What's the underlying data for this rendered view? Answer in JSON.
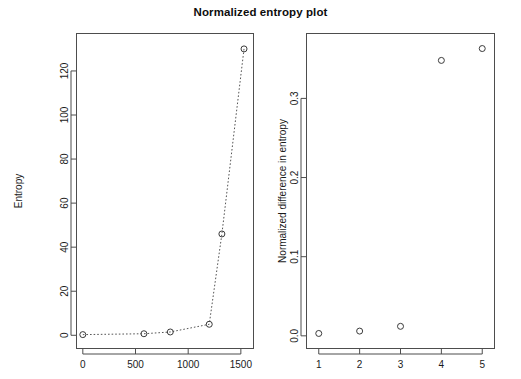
{
  "figure": {
    "title": "Normalized entropy plot",
    "background_color": "#ffffff",
    "foreground_color": "#1a1a1a",
    "marker_color": "#3a3a3a",
    "line_color": "#555555",
    "panel_count": 2
  },
  "chart_data": [
    {
      "type": "line",
      "panel": "left",
      "title": "",
      "xlabel": "",
      "ylabel": "Entropy",
      "xlim": [
        -60,
        1620
      ],
      "ylim": [
        -6,
        137
      ],
      "grid": false,
      "legend": false,
      "marker": "open-circle",
      "linestyle": "dotted",
      "xticks": [
        0,
        500,
        1000,
        1500
      ],
      "xticklabels": [
        "0",
        "500",
        "1000",
        "1500"
      ],
      "yticks": [
        0,
        20,
        40,
        60,
        80,
        100,
        120
      ],
      "yticklabels": [
        "0",
        "20",
        "40",
        "60",
        "80",
        "100",
        "120"
      ],
      "x": [
        0,
        580,
        830,
        1200,
        1320,
        1530
      ],
      "y": [
        0.3,
        0.7,
        1.5,
        5,
        46,
        130
      ],
      "series": [
        {
          "name": "Entropy",
          "points": [
            {
              "x": 0,
              "y": 0.3
            },
            {
              "x": 580,
              "y": 0.7
            },
            {
              "x": 830,
              "y": 1.5
            },
            {
              "x": 1200,
              "y": 5
            },
            {
              "x": 1320,
              "y": 46
            },
            {
              "x": 1530,
              "y": 130
            }
          ]
        }
      ]
    },
    {
      "type": "scatter",
      "panel": "right",
      "title": "",
      "xlabel": "",
      "ylabel": "Normalized difference in entropy",
      "xlim": [
        0.7,
        5.3
      ],
      "ylim": [
        -0.016,
        0.382
      ],
      "grid": false,
      "legend": false,
      "marker": "open-circle",
      "linestyle": "none",
      "xticks": [
        1,
        2,
        3,
        4,
        5
      ],
      "xticklabels": [
        "1",
        "2",
        "3",
        "4",
        "5"
      ],
      "yticks": [
        0.0,
        0.1,
        0.2,
        0.3
      ],
      "yticklabels": [
        "0.0",
        "0.1",
        "0.2",
        "0.3"
      ],
      "x": [
        1,
        2,
        3,
        4,
        5
      ],
      "y": [
        0.003,
        0.006,
        0.012,
        0.348,
        0.363
      ],
      "series": [
        {
          "name": "Normalized difference in entropy",
          "points": [
            {
              "x": 1,
              "y": 0.003
            },
            {
              "x": 2,
              "y": 0.006
            },
            {
              "x": 3,
              "y": 0.012
            },
            {
              "x": 4,
              "y": 0.348
            },
            {
              "x": 5,
              "y": 0.363
            }
          ]
        }
      ]
    }
  ]
}
